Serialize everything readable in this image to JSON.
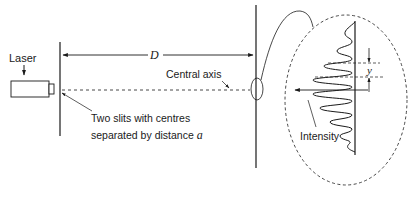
{
  "diagram": {
    "labels": {
      "laser": "Laser",
      "distance_symbol": "D",
      "central_axis": "Central axis",
      "slits_line1": "Two slits with centres",
      "slits_line2_prefix": "separated by distance ",
      "slits_symbol": "a",
      "fringe_spacing_symbol": "y",
      "intensity": "Intensity"
    },
    "components": [
      "laser",
      "double-slit screen",
      "detection screen",
      "magnified interference pattern"
    ],
    "colors": {
      "line": "#1a1a1a",
      "background": "#ffffff"
    }
  }
}
